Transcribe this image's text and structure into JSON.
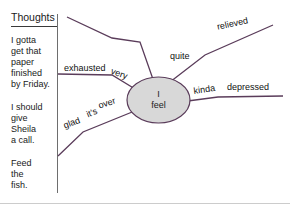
{
  "thoughts_panel": {
    "heading": "Thoughts",
    "notes": [
      "I gotta\nget that\npaper\nfinished\nby Friday.",
      "I should\ngive\nSheila\na call.",
      "Feed\nthe\nfish."
    ]
  },
  "mindmap": {
    "center_line1": "I",
    "center_line2": "feel",
    "labels": {
      "exhausted": "exhausted",
      "very": "very",
      "quite": "quite",
      "relieved": "relieved",
      "kinda": "kinda",
      "depressed": "depressed",
      "over": "over",
      "its": "it's",
      "glad": "glad"
    }
  },
  "colors": {
    "link_line": "#5a3c5a",
    "ellipse_fill": "#d8d8d8",
    "ellipse_stroke": "#5a3c5a",
    "divider": "#6e6e6e",
    "bottom_rule": "#cccccc",
    "text": "#1a1a1a"
  }
}
